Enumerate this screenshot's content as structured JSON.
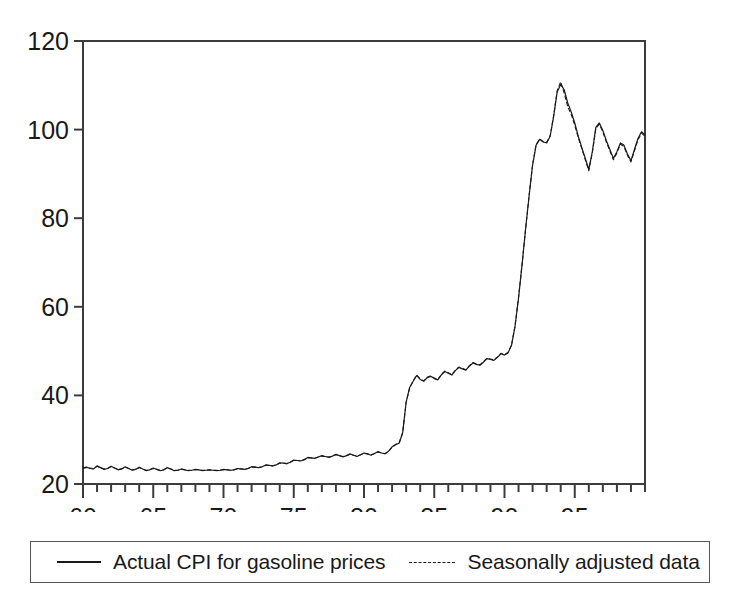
{
  "chart_data": {
    "type": "line",
    "title": "",
    "xlabel": "",
    "ylabel": "",
    "xlim": [
      60,
      100
    ],
    "ylim": [
      20,
      120
    ],
    "grid": false,
    "x_tick_labels": [
      "60",
      "65",
      "70",
      "75",
      "80",
      "85",
      "90",
      "95"
    ],
    "x_tick_values": [
      60,
      65,
      70,
      75,
      80,
      85,
      90,
      95
    ],
    "x_minor_tick_step": 1,
    "y_tick_labels": [
      "20",
      "40",
      "60",
      "80",
      "100",
      "120"
    ],
    "y_tick_values": [
      20,
      40,
      60,
      80,
      100,
      120
    ],
    "legend_position": "below-plot",
    "series": [
      {
        "name": "Actual CPI for gasoline prices",
        "style": "solid",
        "color": "#1a1a1a",
        "x_start": 60.0,
        "x_step": 0.25,
        "values": [
          23.6,
          23.8,
          23.5,
          23.4,
          24.1,
          23.7,
          23.3,
          23.5,
          24.0,
          23.6,
          23.2,
          23.4,
          23.9,
          23.5,
          23.1,
          23.3,
          23.8,
          23.4,
          23.0,
          23.2,
          23.6,
          23.3,
          23.0,
          23.2,
          23.7,
          23.4,
          23.0,
          23.1,
          23.4,
          23.2,
          23.0,
          23.1,
          23.3,
          23.2,
          23.0,
          23.1,
          23.2,
          23.1,
          23.0,
          23.1,
          23.3,
          23.2,
          23.1,
          23.2,
          23.5,
          23.4,
          23.3,
          23.5,
          23.9,
          23.8,
          23.7,
          23.9,
          24.3,
          24.2,
          24.1,
          24.3,
          24.8,
          24.7,
          24.6,
          24.9,
          25.4,
          25.3,
          25.2,
          25.5,
          26.0,
          25.9,
          25.8,
          26.1,
          26.4,
          26.2,
          26.0,
          26.3,
          26.7,
          26.4,
          26.1,
          26.4,
          26.8,
          26.5,
          26.2,
          26.6,
          27.0,
          26.8,
          26.5,
          26.9,
          27.3,
          27.0,
          26.8,
          27.4,
          28.4,
          28.9,
          29.2,
          31.5,
          38.5,
          41.8,
          43.2,
          44.5,
          43.6,
          43.2,
          44.0,
          44.3,
          43.8,
          43.5,
          44.6,
          45.4,
          45.0,
          44.6,
          45.6,
          46.3,
          46.0,
          45.7,
          46.6,
          47.3,
          47.0,
          46.8,
          47.5,
          48.3,
          48.1,
          47.9,
          48.6,
          49.4,
          49.1,
          49.6,
          51.3,
          55.6,
          62.0,
          69.5,
          77.5,
          85.0,
          92.0,
          96.5,
          97.8,
          97.2,
          97.0,
          98.5,
          103.0,
          108.5,
          110.2,
          109.0,
          106.0,
          104.0,
          101.5,
          98.5,
          96.0,
          93.5,
          91.0,
          95.0,
          100.5,
          101.5,
          99.8,
          97.5,
          95.5,
          93.5,
          95.0,
          97.0,
          96.5,
          94.5,
          93.0,
          95.5,
          98.0,
          99.5,
          98.8,
          97.0,
          95.2,
          93.8,
          96.5,
          98.5,
          98.0,
          96.5,
          95.0,
          96.5,
          97.8,
          97.0,
          95.0,
          90.5,
          84.0,
          76.0,
          72.5,
          75.0,
          70.5,
          68.2,
          67.8,
          72.5,
          76.5,
          79.0,
          78.0,
          76.5,
          78.5,
          81.0,
          80.0,
          78.5,
          80.0,
          82.0,
          81.0,
          80.0,
          82.5,
          85.0,
          87.0,
          91.5,
          95.5,
          93.0,
          90.5,
          89.5,
          91.0,
          93.0,
          92.0,
          90.5,
          93.0,
          99.5,
          112.0,
          117.5,
          110.0,
          102.0,
          97.5,
          95.0,
          97.0,
          99.0,
          98.0,
          96.5,
          95.5,
          94.0,
          95.5,
          98.0,
          100.5,
          99.5,
          98.0,
          96.5,
          95.0,
          94.0,
          93.5,
          95.0,
          97.5,
          99.0,
          98.0,
          96.5,
          95.0,
          93.5,
          92.5,
          94.5,
          97.0,
          100.0,
          102.5,
          101.0,
          99.5,
          98.0,
          97.5,
          100.0,
          104.0,
          108.5,
          111.5,
          108.0,
          104.5,
          102.0,
          103.5,
          106.5,
          105.0,
          103.0,
          100.5,
          102.0,
          103.5,
          101.0,
          97.5,
          94.0,
          91.0,
          88.5,
          87.5,
          89.5,
          88.0,
          85.5,
          83.0,
          81.8,
          84.5,
          88.5,
          93.0,
          98.5,
          103.0,
          107.5
        ]
      },
      {
        "name": "Seasonally adjusted data",
        "style": "dashed",
        "color": "#1a1a1a",
        "x_start": 60.0,
        "x_step": 0.25,
        "values": [
          23.6,
          23.7,
          23.6,
          23.5,
          24.0,
          23.7,
          23.4,
          23.5,
          23.9,
          23.6,
          23.3,
          23.4,
          23.8,
          23.5,
          23.2,
          23.3,
          23.7,
          23.4,
          23.1,
          23.2,
          23.5,
          23.3,
          23.1,
          23.2,
          23.6,
          23.4,
          23.1,
          23.1,
          23.3,
          23.2,
          23.1,
          23.1,
          23.2,
          23.2,
          23.1,
          23.1,
          23.2,
          23.1,
          23.1,
          23.1,
          23.2,
          23.2,
          23.1,
          23.2,
          23.4,
          23.4,
          23.3,
          23.5,
          23.8,
          23.8,
          23.7,
          23.9,
          24.2,
          24.2,
          24.1,
          24.3,
          24.7,
          24.7,
          24.6,
          24.9,
          25.3,
          25.3,
          25.2,
          25.5,
          25.9,
          25.9,
          25.8,
          26.1,
          26.3,
          26.2,
          26.1,
          26.3,
          26.6,
          26.4,
          26.2,
          26.4,
          26.7,
          26.5,
          26.3,
          26.6,
          26.9,
          26.8,
          26.6,
          26.9,
          27.2,
          27.0,
          26.9,
          27.4,
          28.3,
          28.9,
          29.3,
          31.6,
          38.4,
          41.7,
          43.3,
          44.6,
          43.7,
          43.3,
          44.1,
          44.4,
          43.9,
          43.6,
          44.7,
          45.5,
          45.1,
          44.7,
          45.7,
          46.4,
          46.1,
          45.8,
          46.7,
          47.4,
          47.1,
          46.9,
          47.6,
          48.4,
          48.2,
          48.0,
          48.7,
          49.5,
          49.2,
          49.7,
          51.4,
          55.7,
          62.1,
          69.6,
          77.6,
          85.1,
          92.1,
          96.6,
          97.9,
          97.3,
          97.1,
          98.6,
          103.2,
          108.8,
          110.8,
          108.2,
          105.2,
          103.4,
          101.0,
          98.2,
          95.7,
          93.2,
          90.7,
          94.7,
          100.2,
          101.2,
          99.5,
          97.2,
          95.2,
          93.2,
          94.7,
          96.7,
          96.2,
          94.2,
          92.7,
          95.2,
          97.7,
          99.2,
          98.5,
          96.7,
          94.9,
          93.5,
          96.2,
          98.2,
          97.7,
          96.2,
          94.7,
          96.2,
          97.5,
          96.7,
          94.7,
          90.2,
          83.7,
          75.7,
          72.2,
          74.7,
          70.2,
          67.9,
          67.5,
          72.2,
          76.2,
          78.7,
          77.7,
          76.2,
          78.2,
          80.7,
          79.7,
          78.2,
          79.7,
          81.7,
          80.7,
          79.7,
          82.2,
          84.7,
          86.7,
          91.2,
          95.2,
          92.7,
          90.2,
          89.2,
          90.7,
          92.7,
          91.7,
          90.2,
          92.7,
          99.2,
          111.5,
          117.0,
          109.5,
          101.5,
          97.2,
          94.7,
          96.7,
          98.7,
          97.7,
          96.2,
          95.2,
          93.7,
          95.2,
          97.7,
          100.2,
          99.2,
          97.7,
          96.2,
          94.7,
          93.7,
          93.2,
          94.7,
          97.2,
          98.7,
          97.7,
          96.2,
          94.7,
          93.2,
          92.2,
          94.2,
          96.7,
          99.7,
          102.2,
          100.7,
          99.2,
          97.7,
          97.2,
          99.7,
          103.7,
          108.2,
          111.0,
          107.5,
          104.0,
          101.5,
          103.0,
          106.0,
          104.5,
          102.5,
          100.0,
          101.5,
          103.0,
          100.5,
          97.0,
          93.5,
          90.5,
          88.0,
          87.0,
          89.0,
          87.5,
          85.0,
          82.5,
          81.3,
          84.0,
          88.0,
          92.5,
          98.0,
          102.5,
          107.0
        ]
      }
    ]
  },
  "legend": {
    "entries": [
      {
        "label": "Actual CPI for gasoline prices",
        "style": "solid"
      },
      {
        "label": "Seasonally adjusted data",
        "style": "dashed"
      }
    ]
  },
  "colors": {
    "line": "#1a1a1a",
    "axis": "#3c3c3c",
    "legend_border": "#55565a",
    "background": "#ffffff"
  }
}
